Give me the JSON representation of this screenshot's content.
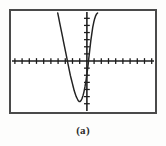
{
  "figure": {
    "caption": "(a)",
    "frame": {
      "x": 9,
      "y": 9,
      "width": 148,
      "height": 105,
      "border_color": "#4a4a4a",
      "background_color": "#ffffff"
    },
    "axis_color": "#1c1c1c",
    "curve_color": "#222222",
    "caption_color": "#2b2b2b"
  },
  "chart_data": {
    "type": "line",
    "title": "",
    "subtitle": "",
    "xlabel": "",
    "ylabel": "",
    "legend": [],
    "legend_position": "none",
    "grid": false,
    "style": "graphing-calculator-screen",
    "axes": {
      "x_axis_visible": true,
      "y_axis_visible": true,
      "x_axis_pixel_y": 61,
      "y_axis_pixel_x": 87,
      "tick_marks": true,
      "tick_spacing_px": 7.4,
      "tick_length_px": 3,
      "tick_labels": [],
      "x_ticks_left_count": 10,
      "x_ticks_right_count": 9,
      "y_ticks_up_count": 7,
      "y_ticks_down_count": 7
    },
    "xlim": [
      -10,
      10
    ],
    "ylim": [
      -10,
      10
    ],
    "series": [
      {
        "name": "parabola",
        "shape": "upward-opening parabola",
        "vertex": [
          -1.1,
          -5.5
        ],
        "x_intercepts": [
          -2.9,
          0.7
        ],
        "points_px": [
          [
            57,
            11
          ],
          [
            58,
            16
          ],
          [
            59,
            21
          ],
          [
            60,
            26
          ],
          [
            61,
            31
          ],
          [
            62,
            36
          ],
          [
            63,
            41
          ],
          [
            64,
            46
          ],
          [
            65,
            51
          ],
          [
            66,
            56
          ],
          [
            67,
            61
          ],
          [
            68,
            66
          ],
          [
            69,
            71
          ],
          [
            70,
            76
          ],
          [
            71,
            80
          ],
          [
            72,
            84
          ],
          [
            73,
            88
          ],
          [
            74,
            92
          ],
          [
            75,
            95
          ],
          [
            76,
            98
          ],
          [
            77,
            100
          ],
          [
            78,
            102
          ],
          [
            79,
            103
          ],
          [
            80,
            103
          ],
          [
            81,
            102
          ],
          [
            82,
            100
          ],
          [
            83,
            97
          ],
          [
            84,
            93
          ],
          [
            85,
            88
          ],
          [
            86,
            82
          ],
          [
            87,
            75
          ],
          [
            88,
            67
          ],
          [
            89,
            58
          ],
          [
            90,
            49
          ],
          [
            91,
            40
          ],
          [
            92,
            33
          ],
          [
            93,
            26
          ],
          [
            94,
            21
          ],
          [
            95,
            17
          ],
          [
            96,
            14
          ],
          [
            97,
            12
          ],
          [
            98,
            11
          ]
        ]
      }
    ]
  }
}
